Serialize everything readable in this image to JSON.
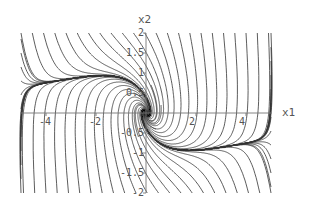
{
  "chart_data": {
    "type": "streamplot",
    "title": "",
    "xlabel": "x1",
    "ylabel": "x2",
    "xlim": [
      -5,
      5
    ],
    "ylim": [
      -2,
      2
    ],
    "grid": false,
    "legend": null,
    "x_ticks": [
      {
        "value": -4,
        "label": "-4"
      },
      {
        "value": -2,
        "label": "-2"
      },
      {
        "value": 2,
        "label": "2"
      },
      {
        "value": 4,
        "label": "4"
      }
    ],
    "y_ticks": [
      {
        "value": 2,
        "label": "2"
      },
      {
        "value": 1.5,
        "label": "1.5"
      },
      {
        "value": 1,
        "label": "1"
      },
      {
        "value": 0.5,
        "label": "0.5"
      },
      {
        "value": -0.5,
        "label": "-0.5"
      },
      {
        "value": -1,
        "label": "-1"
      },
      {
        "value": -1.5,
        "label": "-1.5"
      },
      {
        "value": -2,
        "label": "-2"
      }
    ],
    "features": {
      "equilibrium": {
        "x1": 0,
        "x2": 0,
        "kind": "stable spiral"
      },
      "description": "Phase portrait: diagonal trajectories flowing toward the x1 axis and spiraling into the origin"
    },
    "line_color": "#333333",
    "axis_color": "#777777"
  },
  "labels": {
    "x_axis": "x1",
    "y_axis": "x2"
  }
}
